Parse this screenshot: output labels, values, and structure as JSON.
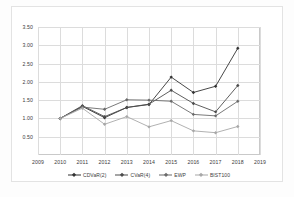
{
  "chart_data": {
    "type": "line",
    "title": "",
    "xlabel": "",
    "ylabel": "",
    "x": [
      2010,
      2011,
      2012,
      2013,
      2014,
      2015,
      2016,
      2017,
      2018
    ],
    "xlim": [
      2009,
      2019
    ],
    "ylim": [
      0.0,
      3.5
    ],
    "yticks": [
      0.5,
      1.0,
      1.5,
      2.0,
      2.5,
      3.0,
      3.5
    ],
    "ytick_labels": [
      "0.50",
      "1.00",
      "1.50",
      "2.00",
      "2.50",
      "3.00",
      "3.50"
    ],
    "xticks": [
      2009,
      2010,
      2011,
      2012,
      2013,
      2014,
      2015,
      2016,
      2017,
      2018,
      2019
    ],
    "xtick_labels": [
      "2009",
      "2010",
      "2011",
      "2012",
      "2013",
      "2014",
      "2015",
      "2016",
      "2017",
      "2018",
      "2019"
    ],
    "grid": true,
    "legend_position": "bottom",
    "series": [
      {
        "name": "CDVaR(2)",
        "color": "#333333",
        "marker": "diamond",
        "values": [
          1.0,
          1.33,
          1.02,
          1.3,
          1.38,
          2.13,
          1.71,
          1.88,
          2.92
        ]
      },
      {
        "name": "CVaR(4)",
        "color": "#4d4d4d",
        "marker": "diamond",
        "values": [
          1.0,
          1.35,
          1.05,
          1.3,
          1.39,
          1.77,
          1.41,
          1.18,
          1.9
        ]
      },
      {
        "name": "EWP",
        "color": "#6b6b6b",
        "marker": "diamond",
        "values": [
          1.0,
          1.31,
          1.25,
          1.51,
          1.5,
          1.47,
          1.11,
          1.07,
          1.47
        ]
      },
      {
        "name": "BIST100",
        "color": "#a8a8a8",
        "marker": "diamond",
        "values": [
          1.0,
          1.28,
          0.84,
          1.05,
          0.77,
          0.94,
          0.66,
          0.61,
          0.78
        ]
      }
    ]
  }
}
